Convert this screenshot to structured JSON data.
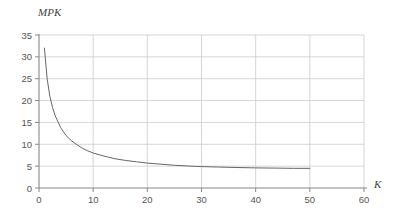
{
  "chart_data": {
    "type": "line",
    "title": "",
    "xlabel": "K",
    "ylabel": "MPK",
    "xlim": [
      0,
      60
    ],
    "ylim": [
      0,
      35
    ],
    "grid": true,
    "legend": null,
    "x_ticks": [
      0,
      10,
      20,
      30,
      40,
      50,
      60
    ],
    "y_ticks": [
      0,
      5,
      10,
      15,
      20,
      25,
      30,
      35
    ],
    "x_tick_labels": [
      "0",
      "10",
      "20",
      "30",
      "40",
      "50",
      "60"
    ],
    "y_tick_labels": [
      "0",
      "5",
      "10",
      "15",
      "20",
      "25",
      "30",
      "35"
    ],
    "series": [
      {
        "name": "MPK",
        "color": "#666666",
        "x": [
          1,
          1.5,
          2,
          2.5,
          3,
          4,
          5,
          6,
          7,
          8,
          9,
          10,
          12,
          14,
          16,
          18,
          20,
          22,
          25,
          28,
          30,
          33,
          36,
          40,
          44,
          47,
          50
        ],
        "values": [
          32.0,
          25.0,
          21.0,
          18.4,
          16.5,
          13.8,
          12.0,
          10.8,
          9.9,
          9.1,
          8.5,
          8.0,
          7.3,
          6.7,
          6.3,
          6.0,
          5.7,
          5.5,
          5.2,
          5.0,
          4.9,
          4.8,
          4.7,
          4.6,
          4.55,
          4.5,
          4.5
        ]
      }
    ]
  },
  "axes": {
    "y_title": "MPK",
    "x_title": "K"
  },
  "colors": {
    "curve": "#666666",
    "grid": "#cccccc",
    "axis": "#888888",
    "text": "#555555",
    "background": "#ffffff"
  }
}
